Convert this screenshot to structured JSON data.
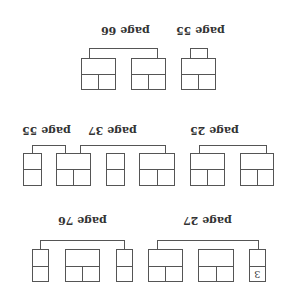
{
  "diagram": {
    "orientation": "rotated 180 degrees",
    "stroke_color": "#555555",
    "text_color": "#333333",
    "groups": [
      {
        "label": "page 66",
        "row": 1,
        "boxes": 2
      },
      {
        "label": "page 55",
        "row": 1,
        "boxes": 1
      },
      {
        "label": "page 55",
        "row": 2,
        "boxes": 1
      },
      {
        "label": "page 37",
        "row": 2,
        "boxes": 3
      },
      {
        "label": "page 25",
        "row": 2,
        "boxes": 2
      },
      {
        "label": "page 76",
        "row": 3,
        "boxes": 3
      },
      {
        "label": "page 27",
        "row": 3,
        "boxes": 3
      }
    ],
    "cell_value": "3"
  }
}
